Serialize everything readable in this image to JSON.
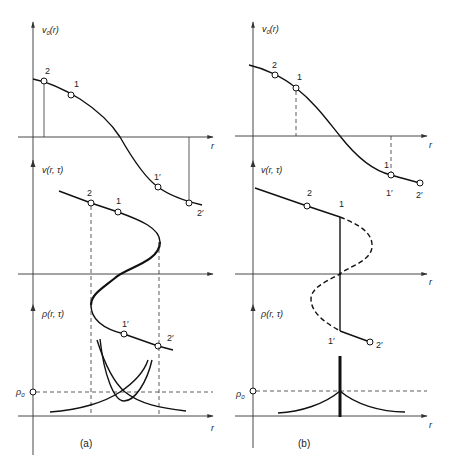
{
  "figure": {
    "panels": [
      {
        "id": "a",
        "caption": "(a)",
        "top": {
          "ylabel": "v0(r)",
          "ylabel_main": "v",
          "ylabel_sub": "0",
          "ylabel_arg": "(r)",
          "xlabel": "r",
          "points": [
            {
              "label": "2"
            },
            {
              "label": "1"
            },
            {
              "label": "1′"
            },
            {
              "label": "2′"
            }
          ]
        },
        "middle": {
          "ylabel": "v(r, τ)",
          "points": [
            {
              "label": "2"
            },
            {
              "label": "1"
            },
            {
              "label": "1′"
            },
            {
              "label": "2′"
            }
          ]
        },
        "bottom": {
          "ylabel": "ρ(r, τ)",
          "xlabel": "r",
          "rho0_label": "ρ0",
          "rho0_main": "ρ",
          "rho0_sub": "0"
        }
      },
      {
        "id": "b",
        "caption": "(b)",
        "top": {
          "ylabel": "v0(r)",
          "ylabel_main": "v",
          "ylabel_sub": "0",
          "ylabel_arg": "(r)",
          "xlabel": "r",
          "points": [
            {
              "label": "2"
            },
            {
              "label": "1"
            },
            {
              "label": "1"
            },
            {
              "label": "1′"
            },
            {
              "label": "2′"
            }
          ]
        },
        "middle": {
          "ylabel": "v(r, τ)",
          "xlabel": "r",
          "points": [
            {
              "label": "2"
            },
            {
              "label": "1"
            },
            {
              "label": "1′"
            },
            {
              "label": "2′"
            }
          ]
        },
        "bottom": {
          "ylabel": "ρ(r, τ)",
          "xlabel": "r",
          "rho0_label": "ρ0",
          "rho0_main": "ρ",
          "rho0_sub": "0"
        }
      }
    ],
    "colors": {
      "ink": "#111111",
      "background": "#ffffff"
    }
  }
}
